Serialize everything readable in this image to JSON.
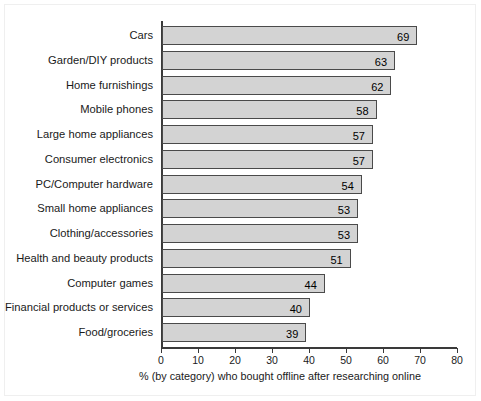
{
  "chart_data": {
    "type": "bar",
    "orientation": "horizontal",
    "title": "",
    "xlabel": "% (by category) who bought offline after researching online",
    "ylabel": "",
    "xlim": [
      0,
      80
    ],
    "xticks": [
      0,
      10,
      20,
      30,
      40,
      50,
      60,
      70,
      80
    ],
    "xtick_labels": [
      "0",
      "10",
      "20",
      "30",
      "40",
      "50",
      "60",
      "70",
      "80"
    ],
    "grid": false,
    "legend": false,
    "value_labels_inside_bars": true,
    "categories": [
      "Cars",
      "Garden/DIY products",
      "Home furnishings",
      "Mobile phones",
      "Large home appliances",
      "Consumer electronics",
      "PC/Computer hardware",
      "Small home appliances",
      "Clothing/accessories",
      "Health and beauty products",
      "Computer games",
      "Financial products or services",
      "Food/groceries"
    ],
    "values": [
      69,
      63,
      62,
      58,
      57,
      57,
      54,
      53,
      53,
      51,
      44,
      40,
      39
    ],
    "value_labels": [
      "69",
      "63",
      "62",
      "58",
      "57",
      "57",
      "54",
      "53",
      "53",
      "51",
      "44",
      "40",
      "39"
    ],
    "colors": {
      "bar_fill": "#d3d3d3",
      "bar_border": "#4a4a4a",
      "axis": "#3a3a3a",
      "text": "#1a1a1a",
      "background": "#ffffff"
    }
  }
}
